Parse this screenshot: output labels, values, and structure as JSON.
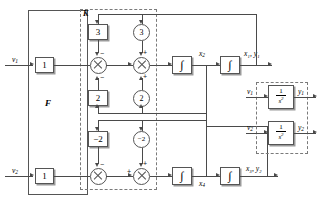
{
  "diagram": {
    "inputs": [
      {
        "id": "v1",
        "label": "v",
        "sub": "1"
      },
      {
        "id": "v2",
        "label": "v",
        "sub": "2"
      }
    ],
    "blocks": {
      "F_label": "F",
      "K_label": "K",
      "f_gain_top": "1",
      "f_gain_bottom": "1",
      "k_gain_3": "3",
      "k_gain_2": "2",
      "k_gain_m2_a": "−2",
      "k_gain_m2_b": "−2",
      "c_gain_3": "3",
      "c_gain_2": "2",
      "c_gain_m2": "−2",
      "integrator": "∫"
    },
    "signals": {
      "x2": {
        "base": "x",
        "sub": "2"
      },
      "x4": {
        "base": "x",
        "sub": "4"
      },
      "x1y1": "x₁, y₁",
      "x3y2": "x₃, y₂"
    },
    "signs": {
      "minus": "−",
      "plus": "+"
    },
    "plant": {
      "tf_numerator": "1",
      "tf_denominator": "s",
      "tf_exponent": "2",
      "in_top": {
        "base": "v",
        "sub": "1"
      },
      "out_top": {
        "base": "y",
        "sub": "1"
      },
      "in_bottom": {
        "base": "v",
        "sub": "2"
      },
      "out_bottom": {
        "base": "y",
        "sub": "2"
      }
    },
    "colors": {
      "line": "#4a4a4a",
      "box_border": "#555555",
      "dash_border": "#7a7a7a",
      "background": "#ffffff"
    }
  }
}
